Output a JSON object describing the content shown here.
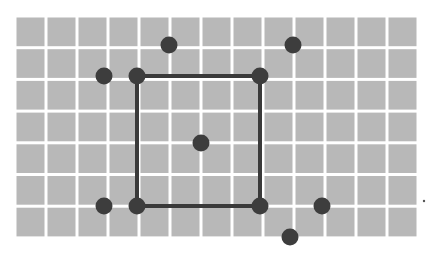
{
  "diagram": {
    "background": "#ffffff",
    "grid": {
      "x0": 15,
      "y0": 16,
      "cols": 13,
      "rows": 7,
      "cell_w": 31,
      "cell_h": 31.7,
      "fill": "#b8b8b8",
      "line_color": "#ffffff",
      "line_width": 3
    },
    "square": {
      "x1": 137,
      "y1": 76,
      "x2": 260,
      "y2": 206,
      "stroke": "#3a3a3a",
      "stroke_width": 4
    },
    "points": [
      {
        "x": 104,
        "y": 76
      },
      {
        "x": 137,
        "y": 76
      },
      {
        "x": 169,
        "y": 45
      },
      {
        "x": 260,
        "y": 76
      },
      {
        "x": 293,
        "y": 45
      },
      {
        "x": 201,
        "y": 143
      },
      {
        "x": 104,
        "y": 206
      },
      {
        "x": 137,
        "y": 206
      },
      {
        "x": 260,
        "y": 206
      },
      {
        "x": 322,
        "y": 206
      },
      {
        "x": 290,
        "y": 237
      }
    ],
    "point_radius": 8.5,
    "point_color": "#3d3d3d",
    "stray_mark": {
      "x": 424,
      "y": 201,
      "r": 1.2,
      "color": "#555555"
    }
  }
}
